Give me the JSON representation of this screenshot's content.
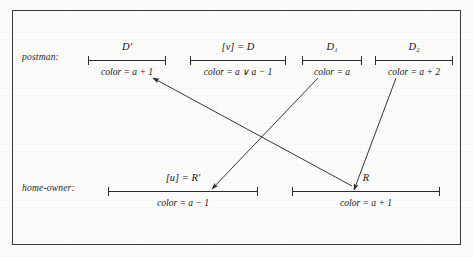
{
  "figure": {
    "frame": {
      "border_color": "#3a3a3a",
      "background": "#fcfcfb"
    },
    "rows": [
      {
        "id": "postman",
        "label": "postman:",
        "label_x": 22,
        "label_y": 57,
        "segments": [
          {
            "id": "d-prime",
            "name": "D′",
            "color_expr": "color = a + 1",
            "x": 88,
            "w": 78
          },
          {
            "id": "v-eq-d",
            "name": "[v] = D",
            "color_expr": "color = a ∨ a − 1",
            "x": 190,
            "w": 96
          },
          {
            "id": "d-one",
            "name": "D₁",
            "color_expr": "color = a",
            "x": 302,
            "w": 60
          },
          {
            "id": "d-two",
            "name": "D₂",
            "color_expr": "color = a + 2",
            "x": 375,
            "w": 78
          }
        ]
      },
      {
        "id": "home-owner",
        "label": "home-owner:",
        "label_x": 22,
        "label_y": 188,
        "segments": [
          {
            "id": "u-eq-r-prime",
            "name": "[u] = R′",
            "color_expr": "color = a − 1",
            "x": 108,
            "w": 150
          },
          {
            "id": "r",
            "name": "R",
            "color_expr": "color = a + 1",
            "x": 292,
            "w": 148
          }
        ]
      }
    ],
    "arrows": [
      {
        "id": "arrow-r-to-d-prime",
        "from_label": "R",
        "to_label": "D′",
        "x1": 352,
        "y1": 186,
        "x2": 153,
        "y2": 78
      },
      {
        "id": "arrow-d1-to-r-prime",
        "from_label": "D₁",
        "to_label": "[u] = R′",
        "x1": 318,
        "y1": 78,
        "x2": 212,
        "y2": 189
      },
      {
        "id": "arrow-d2-to-r",
        "from_label": "D₂",
        "to_label": "R",
        "x1": 396,
        "y1": 78,
        "x2": 354,
        "y2": 190
      }
    ],
    "stroke_color": "#2b2b2b"
  }
}
